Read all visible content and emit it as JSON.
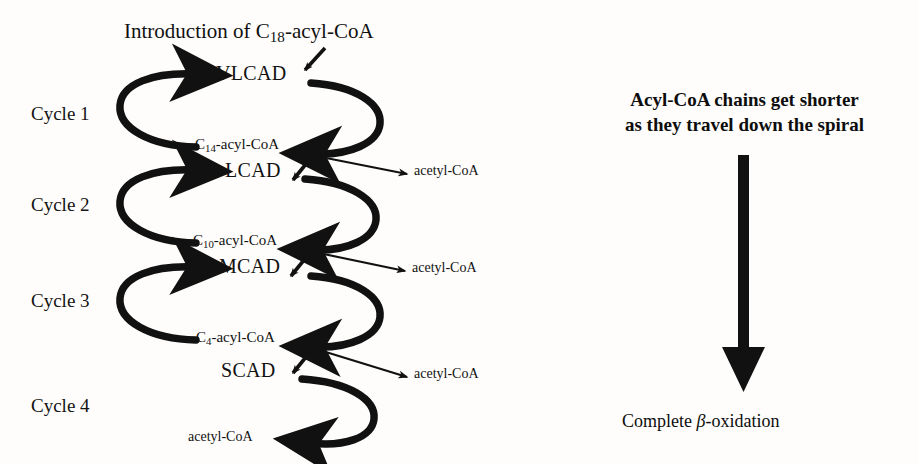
{
  "figure": {
    "title_prefix": "Introduction of C",
    "title_sub": "18",
    "title_suffix": "-acyl-CoA"
  },
  "cycles": [
    {
      "label": "Cycle 1"
    },
    {
      "label": "Cycle 2"
    },
    {
      "label": "Cycle 3"
    },
    {
      "label": "Cycle 4"
    }
  ],
  "enzymes": [
    {
      "label": "VLCAD"
    },
    {
      "label": "LCAD"
    },
    {
      "label": "MCAD"
    },
    {
      "label": "SCAD"
    }
  ],
  "metabolites": [
    {
      "prefix": "C",
      "sub": "14",
      "suffix": "-acyl-CoA"
    },
    {
      "prefix": "C",
      "sub": "10",
      "suffix": "-acyl-CoA"
    },
    {
      "prefix": "C",
      "sub": "4",
      "suffix": "-acyl-CoA"
    }
  ],
  "products": [
    {
      "label": "acetyl-CoA"
    },
    {
      "label": "acetyl-CoA"
    },
    {
      "label": "acetyl-CoA"
    },
    {
      "label": "acetyl-CoA"
    }
  ],
  "annotation": {
    "caption_line1": "Acyl-CoA chains get shorter",
    "caption_line2": "as they travel down the spiral",
    "outcome_prefix": "Complete ",
    "outcome_beta": "β",
    "outcome_suffix": "-oxidation"
  },
  "colors": {
    "ink": "#111111",
    "background": "#fefdfb"
  }
}
